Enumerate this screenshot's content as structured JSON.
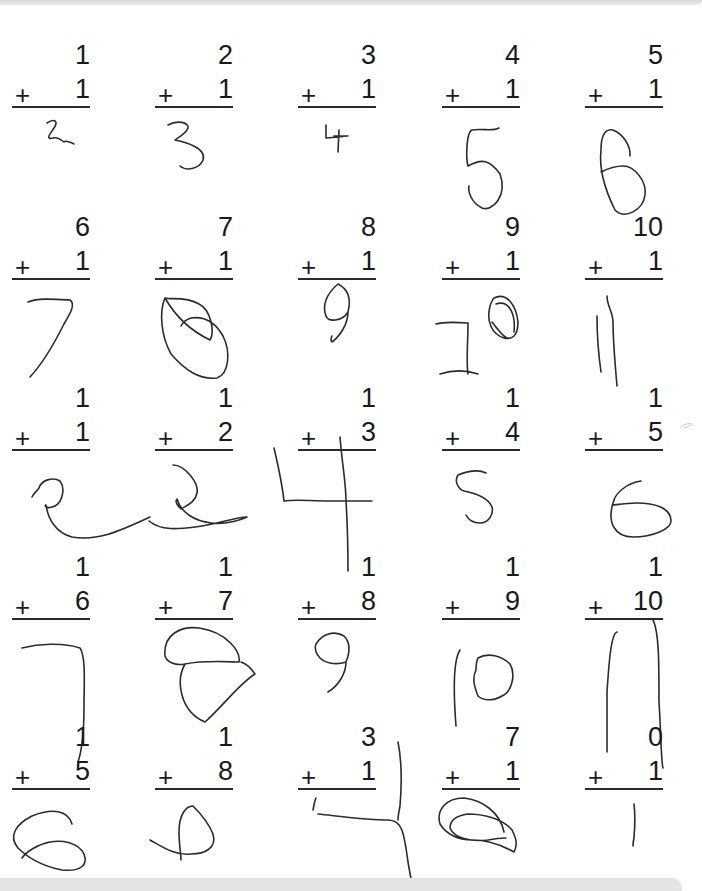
{
  "worksheet": {
    "operator": "+",
    "rows": [
      [
        {
          "top": "1",
          "addend": "1",
          "answer": "2"
        },
        {
          "top": "2",
          "addend": "1",
          "answer": "3"
        },
        {
          "top": "3",
          "addend": "1",
          "answer": "4"
        },
        {
          "top": "4",
          "addend": "1",
          "answer": "5"
        },
        {
          "top": "5",
          "addend": "1",
          "answer": "6"
        }
      ],
      [
        {
          "top": "6",
          "addend": "1",
          "answer": "7"
        },
        {
          "top": "7",
          "addend": "1",
          "answer": "8"
        },
        {
          "top": "8",
          "addend": "1",
          "answer": "9"
        },
        {
          "top": "9",
          "addend": "1",
          "answer": "10"
        },
        {
          "top": "10",
          "addend": "1",
          "answer": "11"
        }
      ],
      [
        {
          "top": "1",
          "addend": "1",
          "answer": "2"
        },
        {
          "top": "1",
          "addend": "2",
          "answer": "3"
        },
        {
          "top": "1",
          "addend": "3",
          "answer": "4"
        },
        {
          "top": "1",
          "addend": "4",
          "answer": "5"
        },
        {
          "top": "1",
          "addend": "5",
          "answer": "6"
        }
      ],
      [
        {
          "top": "1",
          "addend": "6",
          "answer": "7"
        },
        {
          "top": "1",
          "addend": "7",
          "answer": "8"
        },
        {
          "top": "1",
          "addend": "8",
          "answer": "9"
        },
        {
          "top": "1",
          "addend": "9",
          "answer": "10"
        },
        {
          "top": "1",
          "addend": "10",
          "answer": "11"
        }
      ],
      [
        {
          "top": "1",
          "addend": "5",
          "answer": "6"
        },
        {
          "top": "1",
          "addend": "8",
          "answer": "9"
        },
        {
          "top": "3",
          "addend": "1",
          "answer": "4"
        },
        {
          "top": "7",
          "addend": "1",
          "answer": "8"
        },
        {
          "top": "0",
          "addend": "1",
          "answer": "1"
        }
      ]
    ]
  },
  "colors": {
    "paper": "#ffffff",
    "ink_printed": "#1a1a1a",
    "ink_handwritten": "#2b2b2b",
    "scan_border": "#e4e4e4"
  }
}
